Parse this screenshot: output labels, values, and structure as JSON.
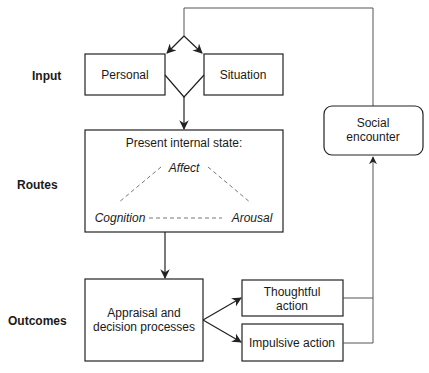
{
  "rows": {
    "input": "Input",
    "routes": "Routes",
    "outcomes": "Outcomes"
  },
  "nodes": {
    "personal": "Personal",
    "situation": "Situation",
    "internal_state": {
      "title": "Present internal state:",
      "affect": "Affect",
      "cognition": "Cognition",
      "arousal": "Arousal"
    },
    "appraisal": [
      "Appraisal and",
      "decision processes"
    ],
    "thoughtful": [
      "Thoughtful",
      "action"
    ],
    "impulsive": "Impulsive action",
    "social": [
      "Social",
      "encounter"
    ]
  },
  "edges": [
    {
      "from": "social",
      "to": "personal"
    },
    {
      "from": "social",
      "to": "situation"
    },
    {
      "from": "personal+situation",
      "to": "internal_state"
    },
    {
      "from": "internal_state",
      "to": "appraisal"
    },
    {
      "from": "appraisal",
      "to": "thoughtful"
    },
    {
      "from": "appraisal",
      "to": "impulsive"
    },
    {
      "from": "thoughtful",
      "to": "social"
    },
    {
      "from": "impulsive",
      "to": "social"
    }
  ],
  "colors": {
    "stroke": "#222222",
    "dashed": "#777777",
    "background": "#ffffff"
  }
}
